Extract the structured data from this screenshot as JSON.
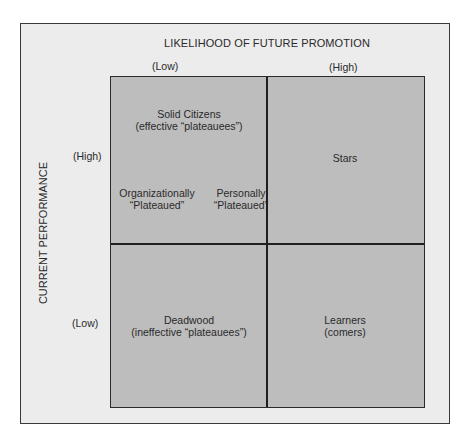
{
  "caption_fragment": "Fig. ... Career plateau matrix (partially cut off)",
  "diagram": {
    "x_axis": {
      "title": "LIKELIHOOD OF FUTURE PROMOTION",
      "low": "(Low)",
      "high": "(High)"
    },
    "y_axis": {
      "title": "CURRENT PERFORMANCE",
      "high": "(High)",
      "low": "(Low)"
    },
    "quadrants": {
      "top_left": {
        "line1": "Solid Citizens",
        "line2": "(effective “plateauees”)",
        "sub_left_line1": "Organizationally",
        "sub_left_line2": "“Plateaued”",
        "sub_right_line1": "Personally",
        "sub_right_line2": "“Plateaued”"
      },
      "top_right": {
        "line1": "Stars"
      },
      "bottom_left": {
        "line1": "Deadwood",
        "line2": "(ineffective “plateauees”)"
      },
      "bottom_right": {
        "line1": "Learners",
        "line2": "(comers)"
      }
    },
    "colors": {
      "frame_bg": "#ececec",
      "grid_bg": "#bdbdbd",
      "lines": "#1f1f1f",
      "text": "#2a2a2a"
    }
  }
}
